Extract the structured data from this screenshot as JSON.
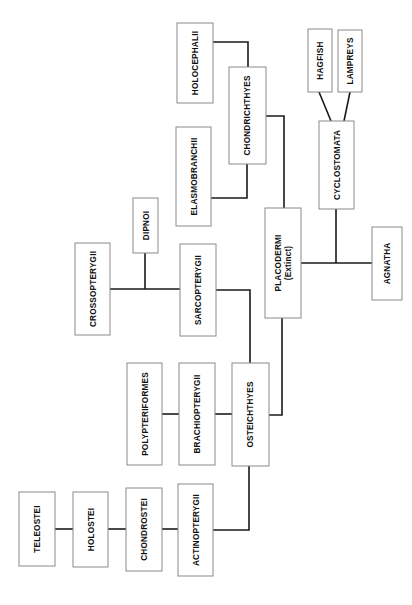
{
  "diagram": {
    "type": "phylogenetic-tree",
    "orientation": "rotated-90-ccw",
    "colors": {
      "box_border": "#8a8a8a",
      "edge": "#1a1a1a",
      "text": "#111111",
      "background": "#ffffff"
    },
    "nodes": {
      "holocephalii": {
        "label": "HOLOCEPHALII"
      },
      "chondrichthyes": {
        "label": "CHONDRICHTHYES"
      },
      "elasmobranchii": {
        "label": "ELASMOBRANCHII"
      },
      "hagfish": {
        "label": "HAGFISH"
      },
      "lampreys": {
        "label": "LAMPREYS"
      },
      "cyclostomata": {
        "label": "CYCLOSTOMATA"
      },
      "dipnoi": {
        "label": "DIPNOI"
      },
      "crossopterygii": {
        "label": "CROSSOPTERYGII"
      },
      "sarcopterygii": {
        "label": "SARCOPTERYGII"
      },
      "placodermi": {
        "label": "PLACODERMI",
        "sublabel": "(Extinct)"
      },
      "agnatha": {
        "label": "AGNATHA"
      },
      "polypteriformes": {
        "label": "POLYPTERIFORMES"
      },
      "brachiopterygii": {
        "label": "BRACHIOPTERYGII"
      },
      "osteichthyes": {
        "label": "OSTEICHTHYES"
      },
      "teleostei": {
        "label": "TELEOSTEI"
      },
      "holostei": {
        "label": "HOLOSTEI"
      },
      "chondrostei": {
        "label": "CHONDROSTEI"
      },
      "actinopterygii": {
        "label": "ACTINOPTERYGII"
      }
    },
    "edges": [
      [
        "holocephalii",
        "chondrichthyes"
      ],
      [
        "elasmobranchii",
        "chondrichthyes"
      ],
      [
        "chondrichthyes",
        "placodermi"
      ],
      [
        "hagfish",
        "cyclostomata"
      ],
      [
        "lampreys",
        "cyclostomata"
      ],
      [
        "cyclostomata",
        "agnatha-junction"
      ],
      [
        "placodermi",
        "agnatha"
      ],
      [
        "dipnoi",
        "sarcopterygii-junction"
      ],
      [
        "crossopterygii",
        "sarcopterygii"
      ],
      [
        "sarcopterygii",
        "osteichthyes"
      ],
      [
        "placodermi",
        "osteichthyes"
      ],
      [
        "polypteriformes",
        "brachiopterygii"
      ],
      [
        "brachiopterygii",
        "osteichthyes"
      ],
      [
        "teleostei",
        "holostei"
      ],
      [
        "holostei",
        "chondrostei"
      ],
      [
        "chondrostei",
        "actinopterygii"
      ],
      [
        "actinopterygii",
        "osteichthyes"
      ]
    ]
  }
}
